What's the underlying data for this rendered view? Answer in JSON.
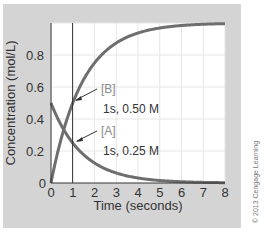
{
  "chart_data": {
    "type": "line",
    "title": "",
    "xlabel": "Time (seconds)",
    "ylabel": "Concentration (mol/L)",
    "xlim": [
      0,
      8
    ],
    "ylim": [
      0,
      1.0
    ],
    "x_ticks": [
      "0",
      "1",
      "2",
      "3",
      "4",
      "5",
      "6",
      "7",
      "8"
    ],
    "y_ticks": [
      "0",
      "0.2",
      "0.4",
      "0.6",
      "0.8"
    ],
    "grid": true,
    "x": [
      0,
      0.5,
      1,
      1.5,
      2,
      3,
      4,
      5,
      6,
      7,
      8
    ],
    "series": [
      {
        "name": "[A]",
        "values": [
          0.5,
          0.35,
          0.25,
          0.18,
          0.125,
          0.063,
          0.031,
          0.016,
          0.008,
          0.004,
          0.002
        ]
      },
      {
        "name": "[B]",
        "values": [
          0.0,
          0.29,
          0.5,
          0.65,
          0.75,
          0.875,
          0.94,
          0.97,
          0.98,
          0.99,
          1.0
        ]
      }
    ],
    "reference_line": {
      "x": 1
    },
    "annotations": [
      {
        "label": "[B]",
        "text": "1s, 0.50 M",
        "x": 1,
        "y": 0.5
      },
      {
        "label": "[A]",
        "text": "1s, 0.25 M",
        "x": 1,
        "y": 0.25
      }
    ],
    "copyright": "© 2013 Cengage Learning"
  },
  "colors": {
    "panel": "#d4d4d4",
    "plot_bg": "#ffffff",
    "grid": "#e6e6e6",
    "curve": "#6e6e6e",
    "axis": "#333333"
  }
}
